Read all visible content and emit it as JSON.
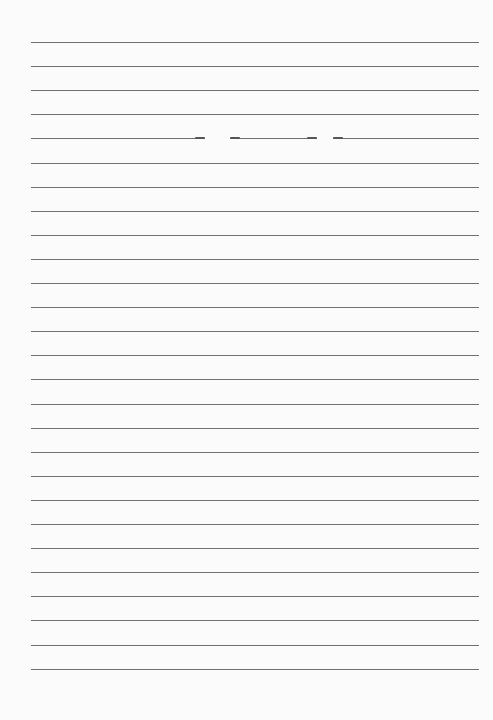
{
  "paper": {
    "type": "lined-paper",
    "background_color": "#fbfbfb",
    "line_color": "#707070",
    "line_count": 27,
    "line_left": 31,
    "line_right": 479,
    "first_line_y": 42,
    "line_spacing": 24.1
  },
  "artifacts": {
    "broken_line_index": 4,
    "gaps": [
      {
        "x_start": 205,
        "x_end": 230
      },
      {
        "x_start": 317,
        "x_end": 333
      }
    ]
  }
}
